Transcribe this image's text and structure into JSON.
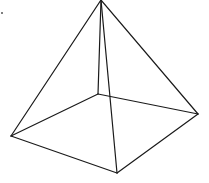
{
  "diagram": {
    "type": "wireframe-square-pyramid",
    "stroke_color": "#1a1a1a",
    "background": "#ffffff",
    "vertices": {
      "apex": {
        "x": 101,
        "y": 0
      },
      "back": {
        "x": 98,
        "y": 94
      },
      "left": {
        "x": 11,
        "y": 136
      },
      "right": {
        "x": 198,
        "y": 114
      },
      "front": {
        "x": 117,
        "y": 173
      }
    },
    "edges": [
      [
        "apex",
        "left"
      ],
      [
        "apex",
        "right"
      ],
      [
        "apex",
        "back"
      ],
      [
        "apex",
        "front"
      ],
      [
        "back",
        "left"
      ],
      [
        "back",
        "right"
      ],
      [
        "left",
        "front"
      ],
      [
        "front",
        "right"
      ]
    ],
    "marks": [
      {
        "name": "corner-dot",
        "x": 2,
        "y": 13
      }
    ]
  }
}
